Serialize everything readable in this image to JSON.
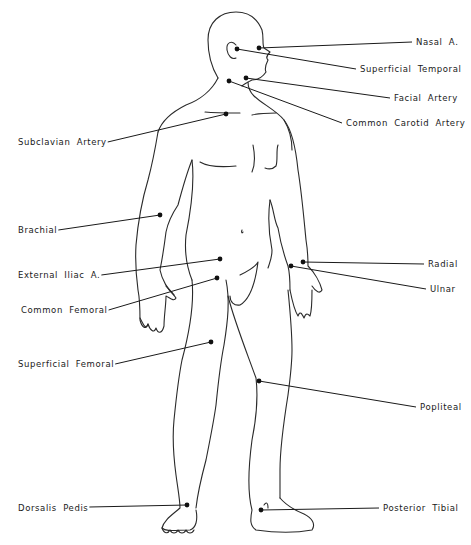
{
  "diagram": {
    "ink_color": "#1a1a1a",
    "background": "#ffffff",
    "pulse_points": [
      {
        "id": "nasal",
        "label": "Nasal A.",
        "side": "right",
        "dot": [
          259,
          48
        ],
        "label_pos": [
          416,
          38
        ],
        "line_end": [
          412,
          42
        ]
      },
      {
        "id": "superficial-temporal",
        "label": "Superficial Temporal",
        "side": "right",
        "dot": [
          237,
          49
        ],
        "label_pos": [
          360,
          65
        ],
        "line_end": [
          356,
          69
        ]
      },
      {
        "id": "facial-artery",
        "label": "Facial Artery",
        "side": "right",
        "dot": [
          246,
          78
        ],
        "label_pos": [
          394,
          94
        ],
        "line_end": [
          390,
          98
        ]
      },
      {
        "id": "common-carotid",
        "label": "Common Carotid Artery",
        "side": "right",
        "dot": [
          229,
          81
        ],
        "label_pos": [
          346,
          119
        ],
        "line_end": [
          342,
          123
        ]
      },
      {
        "id": "subclavian",
        "label": "Subclavian Artery",
        "side": "left",
        "dot": [
          226,
          114
        ],
        "label_pos": [
          18,
          138
        ],
        "line_end": [
          94,
          142
        ]
      },
      {
        "id": "brachial",
        "label": "Brachial",
        "side": "left",
        "dot": [
          160,
          215
        ],
        "label_pos": [
          18,
          226
        ],
        "line_end": [
          54,
          230
        ]
      },
      {
        "id": "external-iliac",
        "label": "External Iliac A.",
        "side": "left",
        "dot": [
          220,
          259
        ],
        "label_pos": [
          18,
          271
        ],
        "line_end": [
          92,
          275
        ]
      },
      {
        "id": "radial",
        "label": "Radial",
        "side": "right",
        "dot": [
          303,
          262
        ],
        "label_pos": [
          428,
          260
        ],
        "line_end": [
          424,
          264
        ]
      },
      {
        "id": "ulnar",
        "label": "Ulnar",
        "side": "right",
        "dot": [
          291,
          266
        ],
        "label_pos": [
          430,
          285
        ],
        "line_end": [
          426,
          289
        ]
      },
      {
        "id": "common-femoral",
        "label": "Common Femoral",
        "side": "left",
        "dot": [
          217,
          278
        ],
        "label_pos": [
          21,
          306
        ],
        "line_end": [
          95,
          310
        ]
      },
      {
        "id": "superficial-femoral",
        "label": "Superficial Femoral",
        "side": "left",
        "dot": [
          211,
          342
        ],
        "label_pos": [
          18,
          360
        ],
        "line_end": [
          104,
          364
        ]
      },
      {
        "id": "popliteal",
        "label": "Popliteal",
        "side": "right",
        "dot": [
          259,
          381
        ],
        "label_pos": [
          420,
          403
        ],
        "line_end": [
          416,
          407
        ]
      },
      {
        "id": "dorsalis-pedis",
        "label": "Dorsalis Pedis",
        "side": "left",
        "dot": [
          187,
          505
        ],
        "label_pos": [
          18,
          504
        ],
        "line_end": [
          79,
          507
        ]
      },
      {
        "id": "posterior-tibial",
        "label": "Posterior Tibial",
        "side": "right",
        "dot": [
          261,
          510
        ],
        "label_pos": [
          383,
          504
        ],
        "line_end": [
          379,
          508
        ]
      }
    ]
  }
}
